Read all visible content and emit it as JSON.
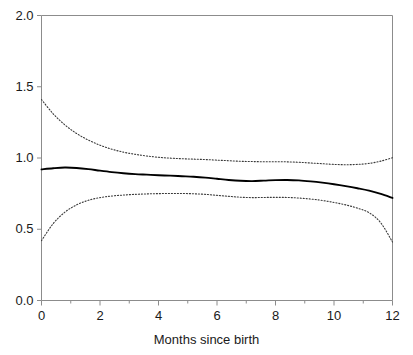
{
  "chart_data": {
    "type": "line",
    "title": "",
    "xlabel": "Months since birth",
    "ylabel": "",
    "xlim": [
      0,
      12
    ],
    "ylim": [
      0.0,
      2.0
    ],
    "grid": false,
    "legend": "none",
    "x_ticks": [
      0,
      2,
      4,
      6,
      8,
      10,
      12
    ],
    "x_tick_labels": [
      "0",
      "2",
      "4",
      "6",
      "8",
      "10",
      "12"
    ],
    "x_minor_ticks": [
      1,
      3,
      5,
      7,
      9,
      11
    ],
    "y_ticks": [
      0.0,
      0.5,
      1.0,
      1.5,
      2.0
    ],
    "y_tick_labels": [
      "0.0",
      "0.5",
      "1.0",
      "1.5",
      "2.0"
    ],
    "x": [
      0,
      0.4,
      0.8,
      1.2,
      1.6,
      2,
      2.4,
      2.8,
      3.2,
      3.6,
      4,
      4.4,
      4.8,
      5.2,
      5.6,
      6,
      6.4,
      6.8,
      7.2,
      7.6,
      8,
      8.4,
      8.8,
      9.2,
      9.6,
      10,
      10.4,
      10.8,
      11.2,
      11.6,
      12
    ],
    "series": [
      {
        "name": "estimate",
        "style": "solid",
        "color": "#000000",
        "width": 1.9,
        "values": [
          0.92,
          0.928,
          0.933,
          0.93,
          0.922,
          0.911,
          0.901,
          0.893,
          0.887,
          0.883,
          0.879,
          0.876,
          0.872,
          0.868,
          0.862,
          0.854,
          0.846,
          0.84,
          0.838,
          0.841,
          0.845,
          0.846,
          0.843,
          0.836,
          0.827,
          0.816,
          0.803,
          0.788,
          0.771,
          0.748,
          0.72
        ]
      },
      {
        "name": "upper-confidence-limit",
        "style": "dotted",
        "color": "#3a3a3a",
        "width": 1.1,
        "values": [
          1.41,
          1.31,
          1.232,
          1.172,
          1.126,
          1.09,
          1.062,
          1.041,
          1.026,
          1.014,
          1.005,
          0.999,
          0.995,
          0.992,
          0.989,
          0.985,
          0.981,
          0.977,
          0.975,
          0.974,
          0.974,
          0.973,
          0.97,
          0.965,
          0.96,
          0.955,
          0.953,
          0.955,
          0.962,
          0.978,
          1.002
        ]
      },
      {
        "name": "lower-confidence-limit",
        "style": "dotted",
        "color": "#3a3a3a",
        "width": 1.1,
        "values": [
          0.42,
          0.54,
          0.62,
          0.671,
          0.703,
          0.722,
          0.733,
          0.74,
          0.745,
          0.748,
          0.75,
          0.751,
          0.751,
          0.749,
          0.745,
          0.738,
          0.731,
          0.725,
          0.722,
          0.723,
          0.724,
          0.723,
          0.719,
          0.712,
          0.702,
          0.688,
          0.671,
          0.648,
          0.616,
          0.545,
          0.41
        ]
      }
    ],
    "axis_color": "#8c8c8c",
    "text_color": "#1a1a1a",
    "background": "#ffffff"
  }
}
